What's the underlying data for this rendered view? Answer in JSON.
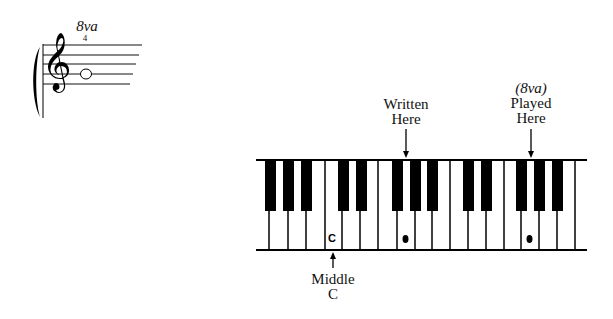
{
  "staff": {
    "octave_marking": "8va",
    "fingering": "4",
    "clef": "treble-clef",
    "clef_glyph": "𝄞",
    "note": "open-whole-note"
  },
  "keyboard": {
    "white_key_lines": [
      269,
      288,
      306,
      325,
      342,
      360,
      378,
      397,
      415,
      432,
      450,
      468,
      486,
      504,
      521,
      539,
      557,
      575
    ],
    "black_keys_left": [
      265,
      283,
      301,
      338,
      356,
      392,
      410,
      427,
      463,
      481,
      516,
      534,
      552
    ],
    "middle_c_key_label": "C",
    "written_marker": "dot",
    "played_marker": "dot"
  },
  "labels": {
    "written_line1": "Written",
    "written_line2": "Here",
    "played_octave": "(8va)",
    "played_line1": "Played",
    "played_line2": "Here",
    "middle_c_line1": "Middle",
    "middle_c_line2": "C"
  },
  "colors": {
    "ink": "#000000",
    "background": "#ffffff"
  }
}
